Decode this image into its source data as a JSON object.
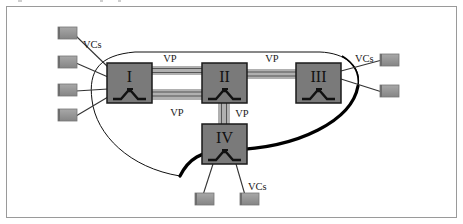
{
  "diagram": {
    "type": "network-topology",
    "colors": {
      "frame": "#9a9a9a",
      "node_fill": "#7a7a7a",
      "node_border": "#1a1a1a",
      "terminal_fill": "#8c8c8c",
      "terminal_shade": "#b5b5b5",
      "pipe_fill": "#b0b0b0",
      "pipe_line": "#555555",
      "curve": "#000000",
      "text": "#1a1a1a"
    },
    "nodes": [
      {
        "id": "I",
        "label": "I",
        "x": 107,
        "y": 63,
        "w": 45,
        "h": 40
      },
      {
        "id": "II",
        "label": "II",
        "x": 202,
        "y": 63,
        "w": 45,
        "h": 40
      },
      {
        "id": "III",
        "label": "III",
        "x": 296,
        "y": 63,
        "w": 45,
        "h": 40
      },
      {
        "id": "IV",
        "label": "IV",
        "x": 202,
        "y": 124,
        "w": 45,
        "h": 40
      }
    ],
    "links": [
      {
        "from": "I",
        "to": "II",
        "label": "VP",
        "label_pos": "above"
      },
      {
        "from": "I",
        "to": "II",
        "label": "VP",
        "label_pos": "below"
      },
      {
        "from": "II",
        "to": "III",
        "label": "VP",
        "label_pos": "above"
      },
      {
        "from": "II",
        "to": "IV",
        "label": "VP",
        "label_pos": "right"
      }
    ],
    "labels": {
      "vp_top_left": "VP",
      "vp_bottom_left": "VP",
      "vp_top_right": "VP",
      "vp_vertical": "VP",
      "vcs_left": "VCs",
      "vcs_right": "VCs",
      "vcs_bottom": "VCs"
    },
    "terminals": {
      "left": [
        {
          "x": 58,
          "y": 27
        },
        {
          "x": 58,
          "y": 56
        },
        {
          "x": 58,
          "y": 84
        },
        {
          "x": 58,
          "y": 109
        }
      ],
      "right": [
        {
          "x": 380,
          "y": 54
        },
        {
          "x": 380,
          "y": 84
        }
      ],
      "bottom": [
        {
          "x": 195,
          "y": 193
        },
        {
          "x": 240,
          "y": 193
        }
      ]
    },
    "curve_label": "VP connection boundary"
  }
}
